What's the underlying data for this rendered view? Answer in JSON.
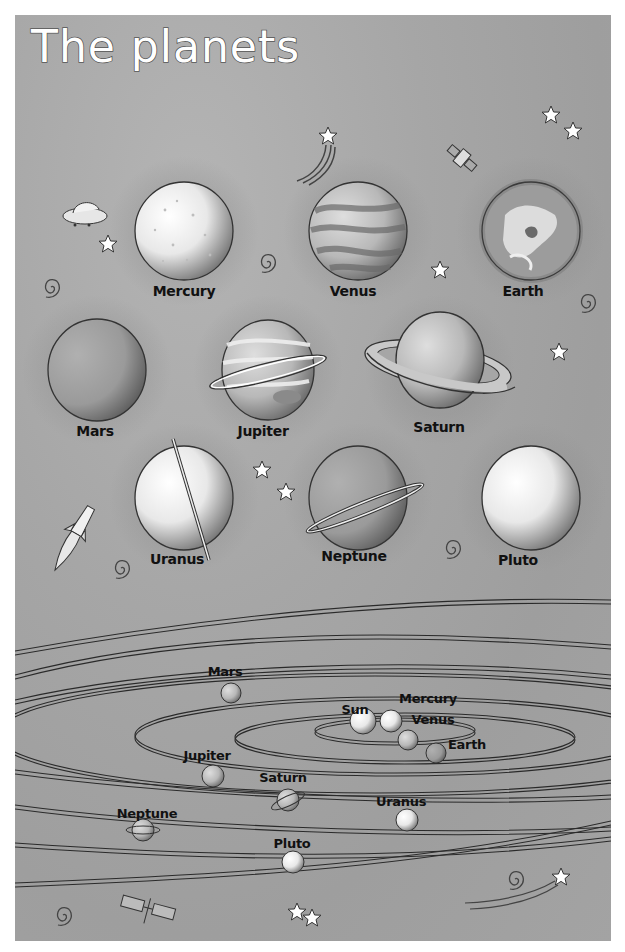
{
  "title": "The planets",
  "colors": {
    "background": "#a6a6a6",
    "border": "#ffffff",
    "title_fill": "#ffffff",
    "title_stroke": "#555555",
    "label_text": "#111111",
    "orbit_line": "#2a2a2a"
  },
  "planet_gallery": {
    "rows": [
      [
        {
          "name": "Mercury",
          "style": "cratered-light"
        },
        {
          "name": "Venus",
          "style": "swirled-bands"
        },
        {
          "name": "Earth",
          "style": "continents-clouds"
        }
      ],
      [
        {
          "name": "Mars",
          "style": "plain-dark"
        },
        {
          "name": "Jupiter",
          "style": "bands-thin-ring"
        },
        {
          "name": "Saturn",
          "style": "wide-rings"
        }
      ],
      [
        {
          "name": "Uranus",
          "style": "vertical-ring"
        },
        {
          "name": "Neptune",
          "style": "tilted-ring"
        },
        {
          "name": "Pluto",
          "style": "plain-light"
        }
      ]
    ]
  },
  "orbit_diagram": {
    "bodies": [
      {
        "name": "Sun"
      },
      {
        "name": "Mercury"
      },
      {
        "name": "Venus"
      },
      {
        "name": "Earth"
      },
      {
        "name": "Mars"
      },
      {
        "name": "Jupiter"
      },
      {
        "name": "Saturn"
      },
      {
        "name": "Uranus"
      },
      {
        "name": "Neptune"
      },
      {
        "name": "Pluto"
      }
    ]
  },
  "decorations": [
    {
      "icon": "flying-saucer-icon"
    },
    {
      "icon": "shooting-star-icon"
    },
    {
      "icon": "satellite-icon"
    },
    {
      "icon": "rocket-icon"
    },
    {
      "icon": "space-probe-icon"
    },
    {
      "icon": "star-icon"
    },
    {
      "icon": "spiral-galaxy-icon"
    }
  ]
}
